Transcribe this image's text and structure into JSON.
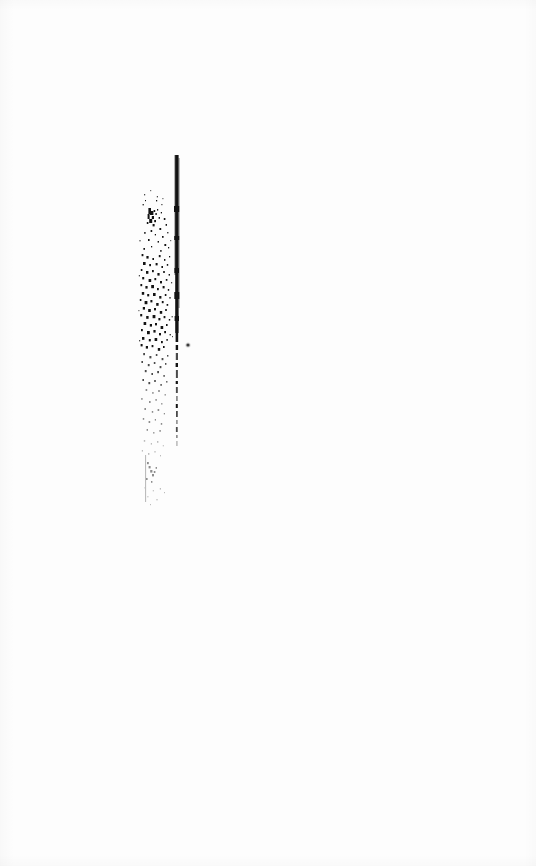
{
  "document": {
    "kind": "scanned-page",
    "title": "Scanned page — blank with binding-edge artifact",
    "page_width": 536,
    "page_height": 866,
    "background_color": "#fdfdfd",
    "ink_color": "#131313",
    "visible_text": "",
    "description": "A near-blank white scanned page. The only visible content is a dark vertical binding-gutter line and a vertical cloud of toner speckle near the left-of-center of the page.",
    "artifacts": {
      "gutter_line": {
        "name": "binding-gutter-line",
        "x": 175,
        "y_top": 155,
        "y_bottom": 440,
        "width": 4,
        "solid_until_y": 332,
        "color": "#131313"
      },
      "speckle_field": {
        "name": "toner-speckle-field",
        "x_left": 138,
        "x_right": 186,
        "y_top": 195,
        "y_bottom": 505,
        "densest_y_range": [
          248,
          345
        ],
        "color": "#131313"
      },
      "isolated_dot": {
        "name": "isolated-speck",
        "x": 188,
        "y": 345,
        "radius": 1.6
      },
      "lower_stroke": {
        "name": "faint-vertical-stroke",
        "x": 145,
        "y_top": 455,
        "y_bottom": 502,
        "color": "#bcbcbc"
      }
    }
  }
}
